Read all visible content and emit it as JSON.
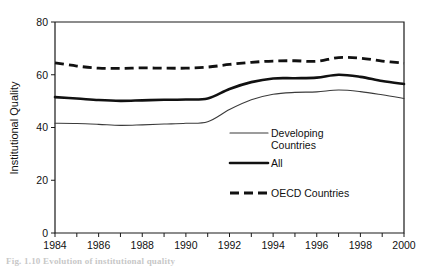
{
  "figure": {
    "caption": "Fig. 1.10   Evolution of institutional quality",
    "background_color": "#ffffff",
    "ink_color": "#111111"
  },
  "chart_data": {
    "type": "line",
    "title": "",
    "xlabel": "",
    "ylabel": "Institutional Quality",
    "xlim": [
      1984,
      2000
    ],
    "ylim": [
      0,
      80
    ],
    "yticks": [
      0,
      20,
      40,
      60,
      80
    ],
    "ytick_labels": [
      "0",
      "20",
      "40",
      "60",
      "80"
    ],
    "xticks": [
      1984,
      1985,
      1986,
      1987,
      1988,
      1989,
      1990,
      1991,
      1992,
      1993,
      1994,
      1995,
      1996,
      1997,
      1998,
      1999,
      2000
    ],
    "xtick_labels": [
      "1984",
      "",
      "1986",
      "",
      "1988",
      "",
      "1990",
      "",
      "1992",
      "",
      "1994",
      "",
      "1996",
      "",
      "1998",
      "",
      "2000"
    ],
    "x": [
      1984,
      1985,
      1986,
      1987,
      1988,
      1989,
      1990,
      1991,
      1992,
      1993,
      1994,
      1995,
      1996,
      1997,
      1998,
      1999,
      2000
    ],
    "grid": false,
    "legend_position": "inside-center-right",
    "series": [
      {
        "name": "Developing Countries",
        "style": "thin-solid",
        "color": "#3b3b3b",
        "values": [
          41.6,
          41.5,
          41.2,
          40.8,
          41.0,
          41.3,
          41.6,
          42.2,
          46.8,
          50.5,
          52.6,
          53.3,
          53.5,
          54.2,
          53.6,
          52.4,
          51.0
        ]
      },
      {
        "name": "All",
        "style": "thick-solid",
        "color": "#111111",
        "values": [
          51.5,
          51.0,
          50.4,
          50.1,
          50.3,
          50.5,
          50.6,
          51.0,
          54.6,
          57.2,
          58.6,
          58.7,
          58.9,
          60.0,
          59.2,
          57.6,
          56.5
        ]
      },
      {
        "name": "OECD Countries",
        "style": "thick-dashed",
        "color": "#111111",
        "values": [
          64.5,
          63.3,
          62.5,
          62.4,
          62.6,
          62.5,
          62.5,
          62.9,
          63.9,
          64.7,
          65.2,
          65.3,
          65.1,
          66.5,
          66.3,
          65.2,
          64.4
        ]
      }
    ],
    "legend": [
      {
        "label_line1": "Developing",
        "label_line2": "Countries",
        "style": "thin-solid"
      },
      {
        "label_line1": "All",
        "label_line2": "",
        "style": "thick-solid"
      },
      {
        "label_line1": "OECD Countries",
        "label_line2": "",
        "style": "thick-dashed"
      }
    ]
  }
}
